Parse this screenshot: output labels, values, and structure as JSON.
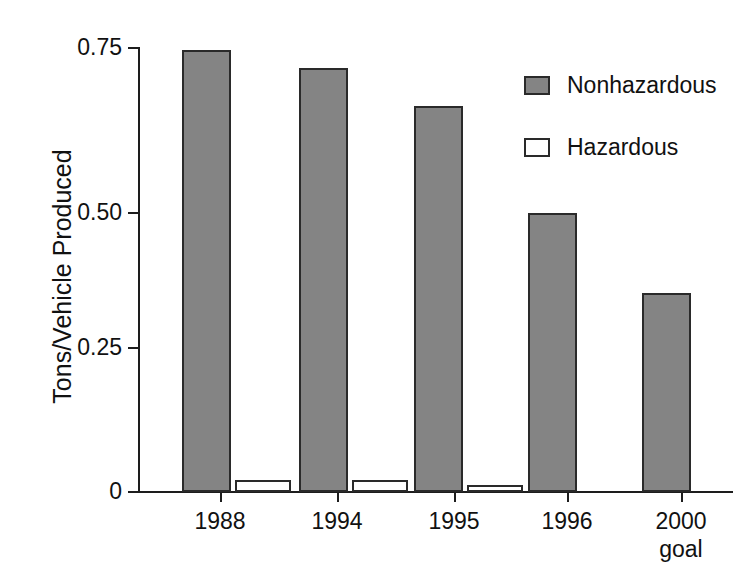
{
  "chart_data": {
    "type": "bar",
    "title": "",
    "subtitle": "",
    "xlabel": "",
    "ylabel": "Tons/Vehicle Produced",
    "categories": [
      "1988",
      "1994",
      "1995",
      "1996",
      "2000"
    ],
    "category_sublabels": [
      "",
      "",
      "",
      "",
      "goal"
    ],
    "series": [
      {
        "name": "Nonhazardous",
        "color": "#848484",
        "values": [
          0.745,
          0.715,
          0.65,
          0.47,
          0.335
        ]
      },
      {
        "name": "Hazardous",
        "color": "#ffffff",
        "values": [
          0.021,
          0.02,
          0.011,
          0,
          0
        ]
      }
    ],
    "ylim": [
      0,
      0.78
    ],
    "yticks": [
      0,
      0.25,
      0.5,
      0.75
    ],
    "ytick_labels": [
      "0",
      "0.25",
      "0.50",
      "0.75"
    ],
    "grid": false,
    "legend_position": "upper-right"
  },
  "legend": {
    "items": [
      {
        "label": "Nonhazardous",
        "swatch": "filled",
        "color": "#848484"
      },
      {
        "label": "Hazardous",
        "swatch": "empty",
        "color": "#ffffff"
      }
    ]
  },
  "axis": {
    "y_title": "Tons/Vehicle Produced",
    "y_labels": [
      "0.75",
      "0.50",
      "0.25",
      "0"
    ],
    "x_labels": [
      "1988",
      "1994",
      "1995",
      "1996",
      "2000"
    ],
    "x_sublabel_last": "goal"
  },
  "colors": {
    "nonhazardous_fill": "#848484",
    "hazardous_fill": "#ffffff",
    "axis": "#1d1d1d",
    "text": "#111111",
    "background": "#ffffff"
  }
}
